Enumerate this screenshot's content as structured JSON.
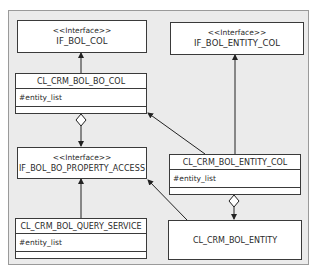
{
  "diagram": {
    "type": "uml-class-diagram",
    "nodes": {
      "if_bol_col": {
        "stereotype": "<<Interface>>",
        "name": "IF_BOL_COL"
      },
      "if_bol_entity_col": {
        "stereotype": "<<Interface>>",
        "name": "IF_BOL_ENTITY_COL"
      },
      "cl_crm_bol_bo_col": {
        "name": "CL_CRM_BOL_BO_COL",
        "attribute": "#entity_list"
      },
      "if_bol_bo_property_access": {
        "stereotype": "<<Interface>>",
        "name": "IF_BOL_BO_PROPERTY_ACCESS"
      },
      "cl_crm_bol_entity_col": {
        "name": "CL_CRM_BOL_ENTITY_COL",
        "attribute": "#entity_list"
      },
      "cl_crm_bol_query_service": {
        "name": "CL_CRM_BOL_QUERY_SERVICE",
        "attribute": "#entity_list"
      },
      "cl_crm_bol_entity": {
        "name": "CL_CRM_BOL_ENTITY"
      }
    },
    "edges": [
      {
        "from": "CL_CRM_BOL_BO_COL",
        "to": "IF_BOL_COL",
        "kind": "implements"
      },
      {
        "from": "CL_CRM_BOL_BO_COL",
        "to": "IF_BOL_BO_PROPERTY_ACCESS",
        "kind": "aggregation"
      },
      {
        "from": "CL_CRM_BOL_ENTITY_COL",
        "to": "CL_CRM_BOL_BO_COL",
        "kind": "inherits"
      },
      {
        "from": "CL_CRM_BOL_ENTITY_COL",
        "to": "IF_BOL_ENTITY_COL",
        "kind": "implements"
      },
      {
        "from": "CL_CRM_BOL_ENTITY_COL",
        "to": "CL_CRM_BOL_ENTITY",
        "kind": "aggregation"
      },
      {
        "from": "CL_CRM_BOL_QUERY_SERVICE",
        "to": "IF_BOL_BO_PROPERTY_ACCESS",
        "kind": "implements"
      },
      {
        "from": "CL_CRM_BOL_ENTITY",
        "to": "IF_BOL_BO_PROPERTY_ACCESS",
        "kind": "implements"
      }
    ]
  }
}
